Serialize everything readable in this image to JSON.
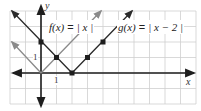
{
  "chart_data": {
    "type": "line",
    "title": "",
    "xlabel": "x",
    "ylabel": "y",
    "xlim": [
      -2,
      10
    ],
    "ylim": [
      -2,
      4
    ],
    "grid": true,
    "tick_labels": {
      "x_unit": "1",
      "y_unit": "1"
    },
    "series": [
      {
        "name": "f(x) = |x|",
        "color": "#8a8a8a",
        "x": [
          -2,
          0,
          4
        ],
        "y": [
          2,
          0,
          4
        ],
        "marked_points": [
          [
            0,
            0
          ],
          [
            1,
            1
          ]
        ]
      },
      {
        "name": "g(x) = |x − 2|",
        "color": "#2a2a2a",
        "x": [
          -2,
          2,
          6
        ],
        "y": [
          4,
          0,
          4
        ],
        "marked_points": [
          [
            0,
            2
          ],
          [
            1,
            1
          ],
          [
            2,
            0
          ],
          [
            3,
            1
          ],
          [
            4,
            2
          ]
        ]
      }
    ],
    "annotations": [
      "f(x) = | x |",
      "g(x) = | x − 2 |"
    ]
  },
  "labels": {
    "f": {
      "lhs": "f(x)",
      "eq": " = ",
      "rhs": "| x |"
    },
    "g": {
      "lhs": "g(x)",
      "eq": " = ",
      "rhs": "| x − 2 |"
    },
    "x_axis": "x",
    "y_axis": "y",
    "x_unit": "1",
    "y_unit": "1"
  },
  "colors": {
    "grid": "#cfcfcf",
    "axis": "#1e1e1e",
    "f_line": "#8a8a8a",
    "g_line": "#2a2a2a",
    "point": "#1e1e1e"
  }
}
